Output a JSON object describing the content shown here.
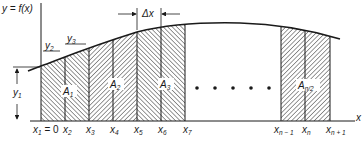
{
  "labels": {
    "function": "y = f(x)",
    "x_axis": "x",
    "delta_x": "Δx",
    "y1": {
      "base": "y",
      "sub": "1"
    },
    "y2": {
      "base": "y",
      "sub": "2"
    },
    "y3": {
      "base": "y",
      "sub": "3"
    }
  },
  "areas": [
    {
      "base": "A",
      "sub": "1"
    },
    {
      "base": "A",
      "sub": "2"
    },
    {
      "base": "A",
      "sub": "3"
    },
    {
      "base": "A",
      "sub": "n/2"
    }
  ],
  "x_ticks": [
    {
      "base": "x",
      "sub": "1",
      "suffix": " = 0"
    },
    {
      "base": "x",
      "sub": "2",
      "suffix": ""
    },
    {
      "base": "x",
      "sub": "3",
      "suffix": ""
    },
    {
      "base": "x",
      "sub": "4",
      "suffix": ""
    },
    {
      "base": "x",
      "sub": "5",
      "suffix": ""
    },
    {
      "base": "x",
      "sub": "6",
      "suffix": ""
    },
    {
      "base": "x",
      "sub": "7",
      "suffix": ""
    },
    {
      "base": "x",
      "sub": "n − 1",
      "suffix": ""
    },
    {
      "base": "x",
      "sub": "n",
      "suffix": ""
    },
    {
      "base": "x",
      "sub": "n + 1",
      "suffix": ""
    }
  ],
  "ellipsis_dots": 5,
  "colors": {
    "ink": "#1a1a1a",
    "background": "#ffffff"
  }
}
